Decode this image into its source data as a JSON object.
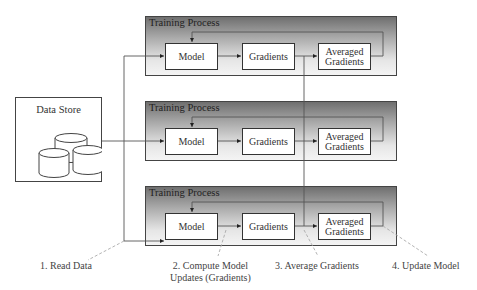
{
  "diagram": {
    "data_store": {
      "label": "Data Store",
      "icon": "database-cylinders-icon"
    },
    "panels": [
      {
        "title": "Training Process",
        "nodes": {
          "model": "Model",
          "gradients": "Gradients",
          "averaged_line1": "Averaged",
          "averaged_line2": "Gradients"
        }
      },
      {
        "title": "Training Process",
        "nodes": {
          "model": "Model",
          "gradients": "Gradients",
          "averaged_line1": "Averaged",
          "averaged_line2": "Gradients"
        }
      },
      {
        "title": "Training Process",
        "nodes": {
          "model": "Model",
          "gradients": "Gradients",
          "averaged_line1": "Averaged",
          "averaged_line2": "Gradients"
        }
      }
    ],
    "steps": [
      {
        "label": "1. Read Data"
      },
      {
        "line1": "2. Compute Model",
        "line2": "Updates (Gradients)"
      },
      {
        "label": "3. Average Gradients"
      },
      {
        "label": "4. Update Model"
      }
    ],
    "colors": {
      "panel_gradient_top": "#6f6f6f",
      "panel_gradient_bottom": "#f4f4f4",
      "stroke": "#444444",
      "dashed_leader": "#aaaaaa"
    }
  }
}
